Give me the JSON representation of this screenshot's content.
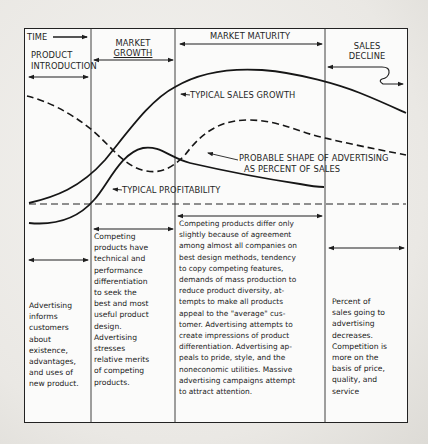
{
  "diagram": {
    "header": {
      "time_label": "TIME",
      "phases": [
        {
          "id": "introduction",
          "label_line1": "PRODUCT",
          "label_line2": "INTRODUCTION"
        },
        {
          "id": "growth",
          "label_line1": "MARKET",
          "label_line2": "GROWTH"
        },
        {
          "id": "maturity",
          "label_line1": "MARKET MATURITY",
          "label_line2": ""
        },
        {
          "id": "decline",
          "label_line1": "SALES",
          "label_line2": "DECLINE"
        }
      ]
    },
    "curves": {
      "sales_label": "TYPICAL SALES GROWTH",
      "advertising_label_line1": "PROBABLE SHAPE OF ADVERTISING",
      "advertising_label_line2": "AS PERCENT OF SALES",
      "profitability_label": "TYPICAL PROFITABILITY"
    },
    "descriptions": [
      {
        "phase": "introduction",
        "text": "Advertising\ninforms\ncustomers\nabout\nexistence,\nadvantages,\nand uses of\nnew product."
      },
      {
        "phase": "growth",
        "text": "Competing\nproducts have\ntechnical and\nperformance\ndifferentiation\nto seek the\nbest and most\nuseful product\ndesign.\nAdvertising\nstresses\nrelative merits\nof competing\nproducts."
      },
      {
        "phase": "maturity",
        "text": "Competing products differ only\nslightly because of agreement\namong almost all companies on\nbest design methods, tendency\nto copy competing features,\ndemands of mass production to\nreduce product diversity, at-\ntempts to make all products\nappeal to the \"average\" cus-\ntomer.  Advertising attempts to\ncreate impressions of product\ndifferentiation. Advertising ap-\npeals to pride, style, and the\nnoneconomic utilities.  Massive\nadvertising campaigns attempt\nto attract attention."
      },
      {
        "phase": "decline",
        "text": "Percent of\nsales going to\nadvertising\ndecreases.\nCompetition is\nmore on the\nbasis of price,\nquality, and\nservice"
      }
    ]
  }
}
